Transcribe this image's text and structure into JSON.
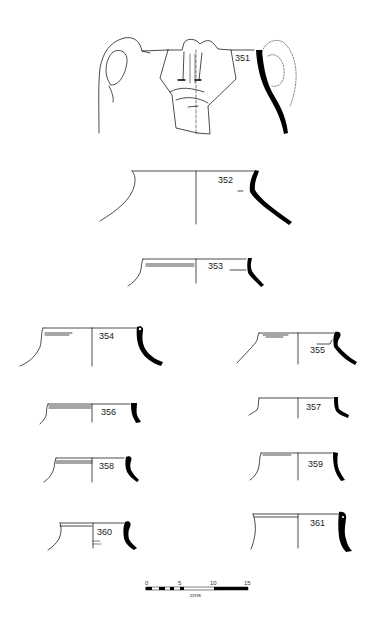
{
  "figure": {
    "type": "pottery-profile-plate",
    "background": "#ffffff",
    "ink": "#000000",
    "vessels": [
      {
        "id": "351",
        "label": "351",
        "form": "two-handled jar with applied face"
      },
      {
        "id": "352",
        "label": "352",
        "form": "large jar rim"
      },
      {
        "id": "353",
        "label": "353",
        "form": "jar rim"
      },
      {
        "id": "354",
        "label": "354",
        "form": "jar rim"
      },
      {
        "id": "355",
        "label": "355",
        "form": "jar rim"
      },
      {
        "id": "356",
        "label": "356",
        "form": "jar rim"
      },
      {
        "id": "357",
        "label": "357",
        "form": "jar rim"
      },
      {
        "id": "358",
        "label": "358",
        "form": "jar rim"
      },
      {
        "id": "359",
        "label": "359",
        "form": "jar rim"
      },
      {
        "id": "360",
        "label": "360",
        "form": "jar rim"
      },
      {
        "id": "361",
        "label": "361",
        "form": "jar rim"
      }
    ],
    "scale_bar": {
      "ticks": [
        "0",
        "5",
        "10",
        "15"
      ],
      "unit": "cms"
    }
  }
}
